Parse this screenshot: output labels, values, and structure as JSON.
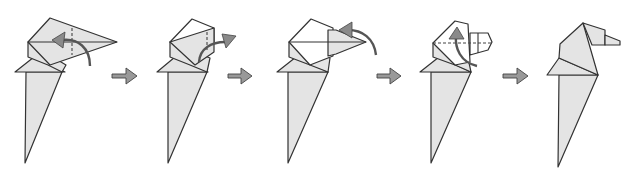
{
  "diagram": {
    "type": "origami-folding-sequence",
    "step_count": 5,
    "colors": {
      "paper": "#e4e4e4",
      "line": "#333333",
      "arrow": "#999999"
    },
    "steps": [
      {
        "index": 1,
        "action": "valley-fold tip back",
        "has_fold_arrow": true,
        "has_valley_line": true
      },
      {
        "index": 2,
        "action": "fold tip outward",
        "has_fold_arrow": true,
        "has_valley_line": true
      },
      {
        "index": 3,
        "action": "fold tip back over",
        "has_fold_arrow": true,
        "has_valley_line": false
      },
      {
        "index": 4,
        "action": "tuck inside",
        "has_fold_arrow": true,
        "has_valley_line": true
      },
      {
        "index": 5,
        "action": "finished head",
        "has_fold_arrow": false,
        "has_valley_line": false
      }
    ],
    "transition_arrows": 4
  }
}
